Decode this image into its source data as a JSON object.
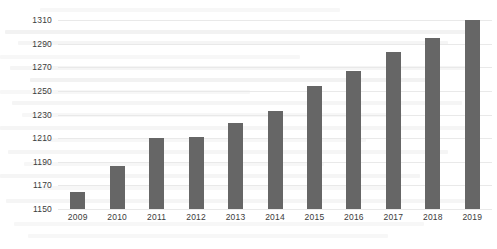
{
  "chart_data": {
    "type": "bar",
    "title": "",
    "xlabel": "",
    "ylabel": "",
    "categories": [
      "2009",
      "2010",
      "2011",
      "2012",
      "2013",
      "2014",
      "2015",
      "2016",
      "2017",
      "2018",
      "2019"
    ],
    "values": [
      1164,
      1186,
      1210,
      1211,
      1223,
      1233,
      1254,
      1267,
      1283,
      1295,
      1310
    ],
    "ylim": [
      1150,
      1310
    ],
    "y_ticks": [
      1150,
      1170,
      1190,
      1210,
      1230,
      1250,
      1270,
      1290,
      1310
    ],
    "y_tick_labels": [
      "1150",
      "1170",
      "1190",
      "1210",
      "1230",
      "1250",
      "1270",
      "1290",
      "1310"
    ],
    "grid": true,
    "legend": false,
    "legend_position": "none",
    "series": [
      {
        "name": "",
        "values": [
          1164,
          1186,
          1210,
          1211,
          1223,
          1233,
          1254,
          1267,
          1283,
          1295,
          1310
        ]
      }
    ],
    "colors": {
      "bar": "#666666",
      "gridline": "#e9e9e9",
      "tick_label": "#3b3b3b",
      "background": "#ffffff"
    }
  }
}
